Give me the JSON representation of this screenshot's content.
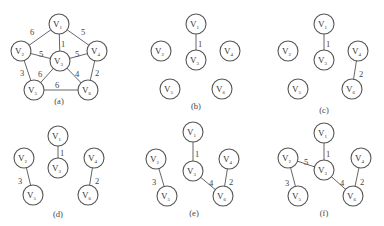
{
  "figure": {
    "node_radius": 10,
    "panels": [
      {
        "id": "a",
        "label": "(a)",
        "label_pos": [
          59,
          104
        ],
        "nodes": [
          {
            "id": "V1",
            "base": "V",
            "sub": "1",
            "x": 59,
            "y": 24
          },
          {
            "id": "V2",
            "base": "V",
            "sub": "2",
            "x": 21,
            "y": 51
          },
          {
            "id": "V3",
            "base": "V",
            "sub": "3",
            "x": 60,
            "y": 61
          },
          {
            "id": "V4",
            "base": "V",
            "sub": "4",
            "x": 97,
            "y": 51
          },
          {
            "id": "V5",
            "base": "V",
            "sub": "5",
            "x": 34,
            "y": 90
          },
          {
            "id": "V6",
            "base": "V",
            "sub": "6",
            "x": 88,
            "y": 90
          }
        ],
        "edges": [
          {
            "from": "V1",
            "to": "V2",
            "weight": "6",
            "lx": 32,
            "ly": 33
          },
          {
            "from": "V1",
            "to": "V4",
            "weight": "5",
            "lx": 83,
            "ly": 33
          },
          {
            "from": "V1",
            "to": "V3",
            "weight": "1",
            "lx": 63,
            "ly": 45
          },
          {
            "from": "V2",
            "to": "V3",
            "weight": "5",
            "lx": 41,
            "ly": 55
          },
          {
            "from": "V3",
            "to": "V4",
            "weight": "5",
            "lx": 77,
            "ly": 55
          },
          {
            "from": "V2",
            "to": "V5",
            "weight": "3",
            "lx": 22,
            "ly": 74
          },
          {
            "from": "V3",
            "to": "V5",
            "weight": "6",
            "lx": 40,
            "ly": 75
          },
          {
            "from": "V3",
            "to": "V6",
            "weight": "4",
            "lx": 77,
            "ly": 75
          },
          {
            "from": "V4",
            "to": "V6",
            "weight": "2",
            "lx": 97,
            "ly": 74
          },
          {
            "from": "V5",
            "to": "V6",
            "weight": "6",
            "lx": 57,
            "ly": 86
          }
        ]
      },
      {
        "id": "b",
        "label": "(b)",
        "label_pos": [
          196,
          109
        ],
        "nodes": [
          {
            "id": "V1",
            "base": "V",
            "sub": "1",
            "x": 196,
            "y": 24
          },
          {
            "id": "V2",
            "base": "V",
            "sub": "2",
            "x": 161,
            "y": 51
          },
          {
            "id": "V3",
            "base": "V",
            "sub": "3",
            "x": 196,
            "y": 60
          },
          {
            "id": "V4",
            "base": "V",
            "sub": "4",
            "x": 230,
            "y": 51
          },
          {
            "id": "V5",
            "base": "V",
            "sub": "5",
            "x": 170,
            "y": 89
          },
          {
            "id": "V6",
            "base": "V",
            "sub": "6",
            "x": 222,
            "y": 89
          }
        ],
        "edges": [
          {
            "from": "V1",
            "to": "V3",
            "weight": "1",
            "lx": 200,
            "ly": 45
          }
        ]
      },
      {
        "id": "c",
        "label": "(c)",
        "label_pos": [
          324,
          113
        ],
        "nodes": [
          {
            "id": "V1",
            "base": "V",
            "sub": "1",
            "x": 324,
            "y": 24
          },
          {
            "id": "V2",
            "base": "V",
            "sub": "2",
            "x": 288,
            "y": 51
          },
          {
            "id": "V3",
            "base": "V",
            "sub": "3",
            "x": 324,
            "y": 60
          },
          {
            "id": "V4",
            "base": "V",
            "sub": "4",
            "x": 358,
            "y": 51
          },
          {
            "id": "V5",
            "base": "V",
            "sub": "5",
            "x": 298,
            "y": 89
          },
          {
            "id": "V6",
            "base": "V",
            "sub": "6",
            "x": 352,
            "y": 89
          }
        ],
        "edges": [
          {
            "from": "V1",
            "to": "V3",
            "weight": "1",
            "lx": 328,
            "ly": 45
          },
          {
            "from": "V4",
            "to": "V6",
            "weight": "2",
            "lx": 361,
            "ly": 75
          }
        ]
      },
      {
        "id": "d",
        "label": "(d)",
        "label_pos": [
          58,
          217
        ],
        "nodes": [
          {
            "id": "V1",
            "base": "V",
            "sub": "1",
            "x": 58,
            "y": 136
          },
          {
            "id": "V2",
            "base": "V",
            "sub": "2",
            "x": 24,
            "y": 158
          },
          {
            "id": "V3",
            "base": "V",
            "sub": "3",
            "x": 58,
            "y": 168
          },
          {
            "id": "V4",
            "base": "V",
            "sub": "4",
            "x": 94,
            "y": 158
          },
          {
            "id": "V5",
            "base": "V",
            "sub": "5",
            "x": 33,
            "y": 195
          },
          {
            "id": "V6",
            "base": "V",
            "sub": "6",
            "x": 88,
            "y": 195
          }
        ],
        "edges": [
          {
            "from": "V1",
            "to": "V3",
            "weight": "1",
            "lx": 62,
            "ly": 154
          },
          {
            "from": "V2",
            "to": "V5",
            "weight": "3",
            "lx": 20,
            "ly": 182
          },
          {
            "from": "V4",
            "to": "V6",
            "weight": "2",
            "lx": 97,
            "ly": 182
          }
        ]
      },
      {
        "id": "e",
        "label": "(e)",
        "label_pos": [
          194,
          216
        ],
        "nodes": [
          {
            "id": "V1",
            "base": "V",
            "sub": "1",
            "x": 193,
            "y": 132
          },
          {
            "id": "V2",
            "base": "V",
            "sub": "2",
            "x": 156,
            "y": 159
          },
          {
            "id": "V3",
            "base": "V",
            "sub": "3",
            "x": 193,
            "y": 171
          },
          {
            "id": "V4",
            "base": "V",
            "sub": "4",
            "x": 229,
            "y": 159
          },
          {
            "id": "V5",
            "base": "V",
            "sub": "5",
            "x": 167,
            "y": 196
          },
          {
            "id": "V6",
            "base": "V",
            "sub": "6",
            "x": 223,
            "y": 196
          }
        ],
        "edges": [
          {
            "from": "V1",
            "to": "V3",
            "weight": "1",
            "lx": 197,
            "ly": 155
          },
          {
            "from": "V2",
            "to": "V5",
            "weight": "3",
            "lx": 154,
            "ly": 183
          },
          {
            "from": "V3",
            "to": "V6",
            "weight": "4",
            "lx": 211,
            "ly": 184
          },
          {
            "from": "V4",
            "to": "V6",
            "weight": "2",
            "lx": 231,
            "ly": 183
          }
        ]
      },
      {
        "id": "f",
        "label": "(f)",
        "label_pos": [
          324,
          216
        ],
        "nodes": [
          {
            "id": "V1",
            "base": "V",
            "sub": "1",
            "x": 324,
            "y": 133
          },
          {
            "id": "V2",
            "base": "V",
            "sub": "2",
            "x": 288,
            "y": 158
          },
          {
            "id": "V3",
            "base": "V",
            "sub": "3",
            "x": 324,
            "y": 170
          },
          {
            "id": "V4",
            "base": "V",
            "sub": "4",
            "x": 361,
            "y": 158
          },
          {
            "id": "V5",
            "base": "V",
            "sub": "5",
            "x": 298,
            "y": 196
          },
          {
            "id": "V6",
            "base": "V",
            "sub": "6",
            "x": 353,
            "y": 196
          }
        ],
        "edges": [
          {
            "from": "V1",
            "to": "V3",
            "weight": "1",
            "lx": 328,
            "ly": 155
          },
          {
            "from": "V2",
            "to": "V3",
            "weight": "5",
            "lx": 306,
            "ly": 163
          },
          {
            "from": "V2",
            "to": "V5",
            "weight": "3",
            "lx": 287,
            "ly": 184
          },
          {
            "from": "V3",
            "to": "V6",
            "weight": "4",
            "lx": 342,
            "ly": 184
          },
          {
            "from": "V4",
            "to": "V6",
            "weight": "2",
            "lx": 362,
            "ly": 183
          }
        ]
      }
    ]
  }
}
